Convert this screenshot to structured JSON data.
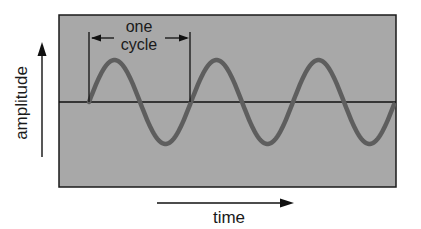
{
  "diagram": {
    "labels": {
      "cycle_line1": "one",
      "cycle_line2": "cycle",
      "y_axis": "amplitude",
      "x_axis": "time"
    },
    "colors": {
      "panel_fill": "#a8a8a8",
      "wave": "#5e5e5e",
      "lines": "#111111",
      "background": "#ffffff"
    },
    "wave": {
      "start_x": 89,
      "baseline_y": 102,
      "period_px": 102,
      "amplitude_px": 42,
      "cycles_visible": 3.1
    }
  }
}
